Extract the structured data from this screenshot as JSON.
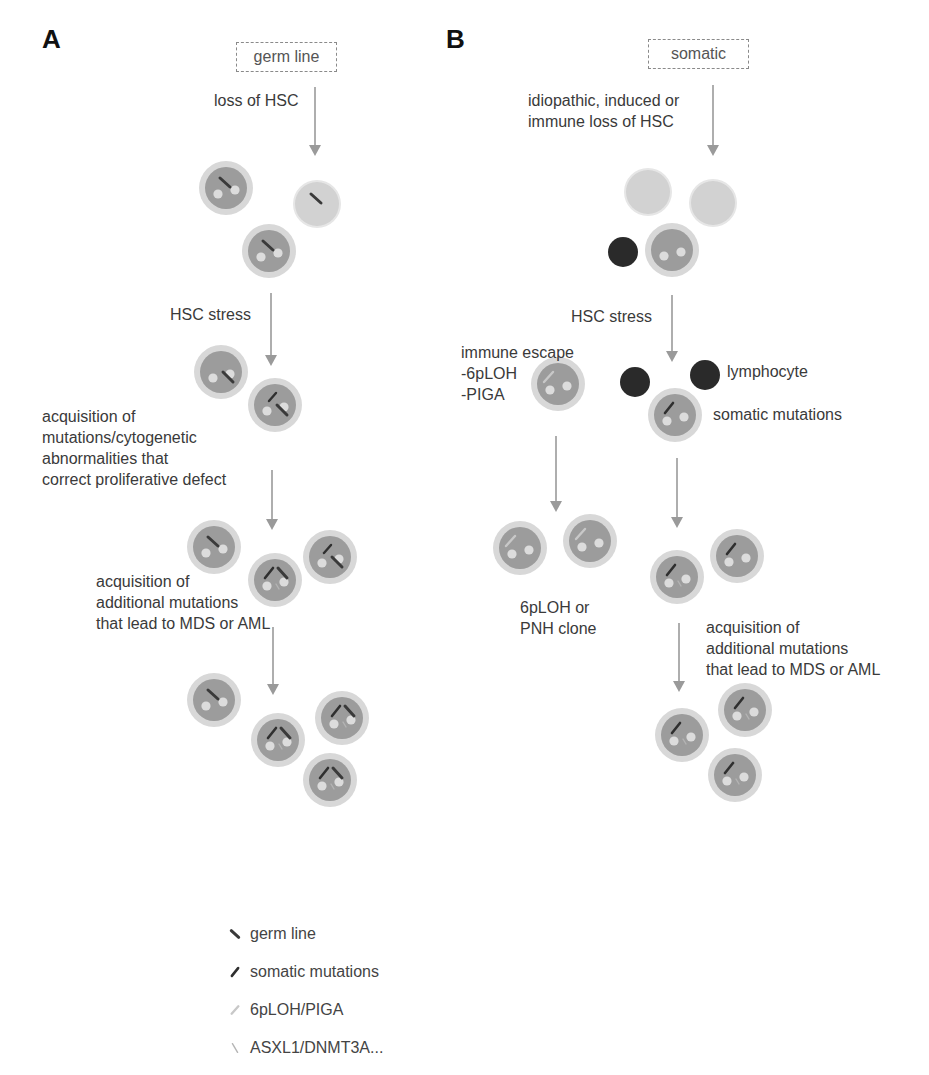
{
  "figure": {
    "panels": [
      {
        "id": "A",
        "letter": "A",
        "letter_pos": [
          42,
          24
        ],
        "origin_box": {
          "label": "germ line",
          "x": 236,
          "y": 42,
          "w": 99,
          "h": 28
        },
        "labels": [
          {
            "key": "loss",
            "text": "loss of HSC",
            "x": 214,
            "y": 90,
            "align": "left"
          },
          {
            "key": "stress",
            "text": "HSC stress",
            "x": 170,
            "y": 304,
            "align": "left"
          },
          {
            "key": "acq1",
            "text": "acquisition of\nmutations/cytogenetic\nabnormalities that\ncorrect proliferative defect",
            "x": 42,
            "y": 406,
            "align": "left"
          },
          {
            "key": "acq2",
            "text": "acquisition of\nadditional mutations\nthat lead to MDS or AML",
            "x": 96,
            "y": 571,
            "align": "left"
          }
        ],
        "arrows": [
          {
            "x": 315,
            "y1": 87,
            "y2": 156
          },
          {
            "x": 271,
            "y1": 293,
            "y2": 366
          },
          {
            "x": 272,
            "y1": 470,
            "y2": 530
          },
          {
            "x": 273,
            "y1": 627,
            "y2": 695
          }
        ],
        "cells": [
          {
            "x": 226,
            "y": 188,
            "r": 27,
            "type": "hsc",
            "marks": [
              "germ"
            ]
          },
          {
            "x": 317,
            "y": 204,
            "r": 22,
            "type": "pale",
            "marks": [
              "germ"
            ]
          },
          {
            "x": 269,
            "y": 251,
            "r": 27,
            "type": "hsc",
            "marks": [
              "germ"
            ]
          },
          {
            "x": 221,
            "y": 372,
            "r": 27,
            "type": "hsc",
            "marks": [
              "germ-low"
            ]
          },
          {
            "x": 275,
            "y": 405,
            "r": 27,
            "type": "hsc",
            "marks": [
              "somatic-up",
              "germ-low"
            ]
          },
          {
            "x": 214,
            "y": 547,
            "r": 27,
            "type": "hsc",
            "marks": [
              "germ"
            ]
          },
          {
            "x": 275,
            "y": 580,
            "r": 27,
            "type": "hsc",
            "marks": [
              "somatic",
              "germ-right",
              "asxl"
            ]
          },
          {
            "x": 330,
            "y": 557,
            "r": 27,
            "type": "hsc",
            "marks": [
              "somatic-up",
              "germ-low"
            ]
          },
          {
            "x": 214,
            "y": 700,
            "r": 27,
            "type": "hsc",
            "marks": [
              "germ"
            ]
          },
          {
            "x": 278,
            "y": 740,
            "r": 27,
            "type": "hsc",
            "marks": [
              "somatic",
              "germ-right",
              "asxl"
            ]
          },
          {
            "x": 342,
            "y": 718,
            "r": 27,
            "type": "hsc",
            "marks": [
              "somatic",
              "germ-right",
              "asxl"
            ]
          },
          {
            "x": 330,
            "y": 780,
            "r": 27,
            "type": "hsc",
            "marks": [
              "somatic",
              "germ-right",
              "asxl"
            ]
          }
        ]
      },
      {
        "id": "B",
        "letter": "B",
        "letter_pos": [
          446,
          24
        ],
        "origin_box": {
          "label": "somatic",
          "x": 648,
          "y": 39,
          "w": 99,
          "h": 28
        },
        "labels": [
          {
            "key": "loss",
            "text": "idiopathic, induced or\nimmune loss of HSC",
            "x": 528,
            "y": 90,
            "align": "left"
          },
          {
            "key": "stress",
            "text": "HSC stress",
            "x": 571,
            "y": 306,
            "align": "left"
          },
          {
            "key": "escape",
            "text": "immune escape\n-6pLOH\n-PIGA",
            "x": 461,
            "y": 342,
            "align": "left"
          },
          {
            "key": "lymph",
            "text": "lymphocyte",
            "x": 727,
            "y": 361,
            "align": "left"
          },
          {
            "key": "somatic",
            "text": "somatic mutations",
            "x": 713,
            "y": 404,
            "align": "left"
          },
          {
            "key": "clone",
            "text": "6pLOH or\nPNH clone",
            "x": 520,
            "y": 597,
            "align": "left"
          },
          {
            "key": "acq2",
            "text": "acquisition of\nadditional mutations\nthat lead to MDS or AML",
            "x": 706,
            "y": 617,
            "align": "left"
          }
        ],
        "arrows": [
          {
            "x": 713,
            "y1": 85,
            "y2": 156
          },
          {
            "x": 672,
            "y1": 295,
            "y2": 362
          },
          {
            "x": 556,
            "y1": 436,
            "y2": 512
          },
          {
            "x": 677,
            "y1": 458,
            "y2": 528
          },
          {
            "x": 679,
            "y1": 623,
            "y2": 692
          }
        ],
        "cells": [
          {
            "x": 648,
            "y": 192,
            "r": 22,
            "type": "pale",
            "marks": []
          },
          {
            "x": 713,
            "y": 203,
            "r": 22,
            "type": "pale",
            "marks": []
          },
          {
            "x": 623,
            "y": 252,
            "r": 15,
            "type": "lymphocyte",
            "marks": []
          },
          {
            "x": 672,
            "y": 250,
            "r": 27,
            "type": "hsc",
            "marks": []
          },
          {
            "x": 558,
            "y": 384,
            "r": 27,
            "type": "hsc",
            "marks": [
              "piga"
            ]
          },
          {
            "x": 635,
            "y": 382,
            "r": 15,
            "type": "lymphocyte",
            "marks": []
          },
          {
            "x": 705,
            "y": 375,
            "r": 15,
            "type": "lymphocyte",
            "marks": []
          },
          {
            "x": 675,
            "y": 415,
            "r": 27,
            "type": "hsc",
            "marks": [
              "somatic"
            ]
          },
          {
            "x": 520,
            "y": 548,
            "r": 27,
            "type": "hsc",
            "marks": [
              "piga"
            ]
          },
          {
            "x": 590,
            "y": 541,
            "r": 27,
            "type": "hsc",
            "marks": [
              "piga"
            ]
          },
          {
            "x": 677,
            "y": 577,
            "r": 27,
            "type": "hsc",
            "marks": [
              "somatic",
              "asxl"
            ]
          },
          {
            "x": 737,
            "y": 556,
            "r": 27,
            "type": "hsc",
            "marks": [
              "somatic"
            ]
          },
          {
            "x": 682,
            "y": 735,
            "r": 27,
            "type": "hsc",
            "marks": [
              "somatic",
              "asxl"
            ]
          },
          {
            "x": 745,
            "y": 710,
            "r": 27,
            "type": "hsc",
            "marks": [
              "somatic",
              "asxl"
            ]
          },
          {
            "x": 735,
            "y": 775,
            "r": 27,
            "type": "hsc",
            "marks": [
              "somatic",
              "asxl"
            ]
          }
        ]
      }
    ],
    "legend": {
      "x": 228,
      "y": 925,
      "row_gap": 38,
      "items": [
        {
          "mark": "germ",
          "label": "germ line"
        },
        {
          "mark": "somatic",
          "label": "somatic mutations"
        },
        {
          "mark": "piga",
          "label": "6pLOH/PIGA"
        },
        {
          "mark": "asxl",
          "label": "ASXL1/DNMT3A..."
        }
      ]
    },
    "colors": {
      "background": "#ffffff",
      "arrow": "#9a9a9a",
      "box_border": "#8a8a8a",
      "cell_halo": "#d8d8d8",
      "cell_body": "#9c9c9c",
      "cell_nucleoli": "#dcdcdc",
      "pale_cell": "#d2d2d2",
      "lymphocyte": "#2a2a2a",
      "mark_germ": "#3a3a3a",
      "mark_somatic": "#2f2f2f",
      "mark_piga": "#c8c8c8",
      "mark_asxl": "#b4b4b4"
    }
  }
}
